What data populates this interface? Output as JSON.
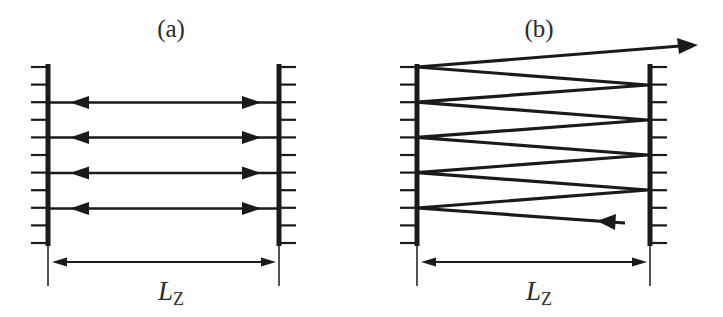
{
  "figure": {
    "panels": [
      {
        "id": "a",
        "label": "(a)",
        "description": "Standing-wave cavity: light bounces back and forth between two mirrors along parallel paths",
        "dimension_label": "L",
        "dimension_subscript": "Z"
      },
      {
        "id": "b",
        "label": "(b)",
        "description": "Zig-zag multipass: beam enters, reflects between mirrors with increasing angle, and exits",
        "dimension_label": "L",
        "dimension_subscript": "Z"
      }
    ],
    "colors": {
      "ink": "#1a1a1a",
      "background": "#ffffff"
    }
  }
}
